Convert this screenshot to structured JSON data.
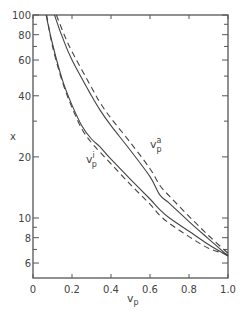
{
  "chart_data": {
    "type": "line",
    "title": "",
    "xlabel": "v_p",
    "ylabel": "x",
    "xlim": [
      0,
      1.0
    ],
    "ylim": [
      5,
      100
    ],
    "yscale": "log",
    "grid": false,
    "legend": "none (curves labeled inline)",
    "xticks": [
      0,
      0.2,
      0.4,
      0.6,
      0.8,
      1.0
    ],
    "xtick_labels": [
      "0",
      "0.2",
      "0.4",
      "0.6",
      "0.8",
      "1.0"
    ],
    "yticks_major": [
      100,
      80,
      60,
      40,
      20,
      10,
      8,
      6
    ],
    "ytick_labels": [
      "100",
      "80",
      "60",
      "40",
      "20",
      "10",
      "8",
      "6"
    ],
    "yticks_minor": [
      90,
      70,
      50,
      30,
      9,
      7,
      5
    ],
    "annotations": [
      {
        "text": "v",
        "sup": "a",
        "sub": "p",
        "near": "upper solid/dashed pair",
        "x": 0.6,
        "y": 22
      },
      {
        "text": "v",
        "sup": "i",
        "sub": "p",
        "near": "lower solid/dashed pair",
        "x": 0.25,
        "y": 16
      }
    ],
    "series": [
      {
        "name": "v_p^a (solid)",
        "style": "solid",
        "x": [
          0.11,
          0.15,
          0.2,
          0.3,
          0.344,
          0.4,
          0.5,
          0.6,
          0.65,
          0.7,
          0.8,
          0.9,
          1.0
        ],
        "y": [
          100,
          78,
          60,
          40,
          34,
          28.5,
          21.5,
          16.0,
          13.0,
          11.8,
          9.6,
          7.9,
          6.5
        ]
      },
      {
        "name": "v_p^a (dashed)",
        "style": "dashed",
        "x": [
          0.12,
          0.16,
          0.2,
          0.3,
          0.344,
          0.4,
          0.5,
          0.6,
          0.65,
          0.7,
          0.8,
          0.9,
          1.0
        ],
        "y": [
          100,
          80,
          66,
          44,
          37,
          31,
          23.5,
          17.5,
          14.5,
          12.8,
          10.2,
          8.2,
          6.7
        ]
      },
      {
        "name": "v_p^i (solid)",
        "style": "solid",
        "x": [
          0.067,
          0.1,
          0.15,
          0.2,
          0.25,
          0.3,
          0.344,
          0.4,
          0.5,
          0.6,
          0.65,
          0.7,
          0.8,
          0.9,
          1.0
        ],
        "y": [
          100,
          72,
          48,
          36,
          28.5,
          24.5,
          22.4,
          19.5,
          15.5,
          12.4,
          11.0,
          10.0,
          8.6,
          7.4,
          6.5
        ]
      },
      {
        "name": "v_p^i (dashed)",
        "style": "dashed",
        "x": [
          0.07,
          0.1,
          0.15,
          0.2,
          0.25,
          0.3,
          0.344,
          0.4,
          0.5,
          0.6,
          0.65,
          0.7,
          0.8,
          0.9,
          1.0
        ],
        "y": [
          100,
          70,
          47,
          35,
          27.5,
          23.5,
          21.1,
          18.5,
          14.6,
          11.7,
          10.3,
          9.4,
          8.1,
          7.1,
          6.6
        ]
      }
    ]
  },
  "labels": {
    "xlabel_main": "v",
    "xlabel_sub": "p",
    "ylabel": "x",
    "va_main": "v",
    "va_sup": "a",
    "va_sub": "p",
    "vi_main": "v",
    "vi_sup": "i",
    "vi_sub": "p"
  }
}
